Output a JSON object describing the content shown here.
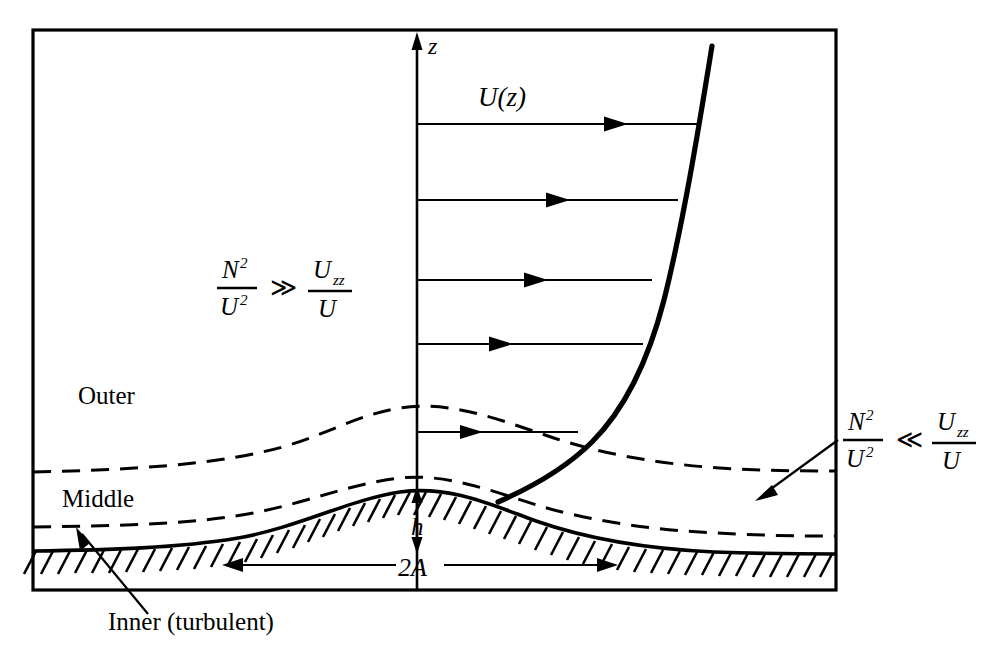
{
  "figure": {
    "domain": "Diagram",
    "caption_remnant": "",
    "frame": {
      "x": 33,
      "y": 30,
      "width": 803,
      "height": 560,
      "stroke": "#000000"
    },
    "background": "#ffffff",
    "ink_color": "#000000"
  },
  "axis": {
    "vertical_label": "z",
    "x": 417,
    "top_y": 38,
    "bottom_y": 590
  },
  "profile": {
    "curve_label": "U(z)",
    "curve_label_x": 505,
    "curve_label_y": 104,
    "description": "boundary-layer velocity profile curve"
  },
  "velocity_arrows": [
    {
      "y": 124,
      "tip_x": 648
    },
    {
      "y": 200,
      "tip_x": 665
    },
    {
      "y": 280,
      "tip_x": 670
    },
    {
      "y": 344,
      "tip_x": 661
    },
    {
      "y": 432,
      "tip_x": 580
    }
  ],
  "regions": [
    {
      "name": "Outer",
      "label": "Outer",
      "x": 78,
      "y": 404
    },
    {
      "name": "Middle",
      "label": "Middle",
      "x": 62,
      "y": 506
    },
    {
      "name": "Inner",
      "label": "Inner (turbulent)",
      "x": 108,
      "y": 629
    }
  ],
  "equations": {
    "outer": {
      "numerator_left": "N",
      "numerator_left_sup": "2",
      "denominator_left": "U",
      "denominator_left_sup": "2",
      "relation": "≫",
      "numerator_right": "U",
      "numerator_right_sub": "zz",
      "denominator_right": "U",
      "x": 222,
      "y": 285
    },
    "inner": {
      "numerator_left": "N",
      "numerator_left_sup": "2",
      "denominator_left": "U",
      "denominator_left_sup": "2",
      "relation": "≪",
      "numerator_right": "U",
      "numerator_right_sub": "zz",
      "denominator_right": "U",
      "x": 848,
      "y": 436
    }
  },
  "dimensions": {
    "height_label": "h",
    "height_label_x": 421,
    "height_label_y": 534,
    "width_label": "2A",
    "width_label_x": 417,
    "width_label_y": 572,
    "width_arrow_left_x": 225,
    "width_arrow_right_x": 610,
    "width_arrow_y": 565
  },
  "terrain": {
    "crest_x": 417,
    "crest_y": 490,
    "base_y": 545,
    "hatch_count": 46,
    "description": "hill profile with hatched ground beneath"
  },
  "pointers": [
    {
      "name": "inner-pointer",
      "from_x": 148,
      "from_y": 615,
      "to_x": 78,
      "to_y": 540
    },
    {
      "name": "inner-region-pointer",
      "from_x": 838,
      "from_y": 440,
      "to_x": 756,
      "to_y": 500
    }
  ]
}
